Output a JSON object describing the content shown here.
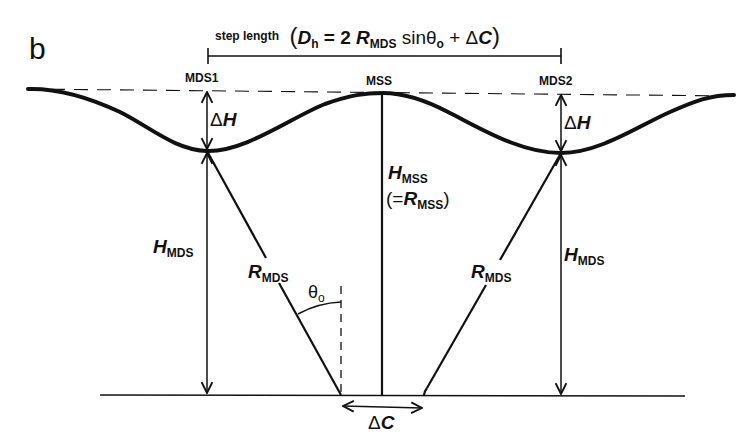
{
  "figure": {
    "panel_label": "b",
    "step_length": {
      "label": "step length",
      "formula_open": "(",
      "formula_D": "D",
      "formula_D_sub": "h",
      "formula_eq": " = 2",
      "formula_R": "R",
      "formula_R_sub": "MDS",
      "formula_sin": " sinθ",
      "formula_sin_sub": "o",
      "formula_plus": " + Δ",
      "formula_C": "C",
      "formula_close": ")"
    },
    "points": {
      "mds1": "MDS1",
      "mss": "MSS",
      "mds2": "MDS2"
    },
    "labels": {
      "delta_h_left_delta": "Δ",
      "delta_h_left_H": "H",
      "delta_h_right_delta": "Δ",
      "delta_h_right_H": "H",
      "h_mds_left": "H",
      "h_mds_left_sub": "MDS",
      "h_mds_right": "H",
      "h_mds_right_sub": "MDS",
      "r_mds_left": "R",
      "r_mds_left_sub": "MDS",
      "r_mds_right": "R",
      "r_mds_right_sub": "MDS",
      "h_mss": "H",
      "h_mss_sub": "MSS",
      "r_mss_open": "(=",
      "r_mss": "R",
      "r_mss_sub": "MSS",
      "r_mss_close": ")",
      "theta": "θ",
      "theta_sub": "o",
      "delta_c_delta": "Δ",
      "delta_c_C": "C"
    },
    "colors": {
      "ink": "#111111",
      "background": "#ffffff"
    }
  }
}
